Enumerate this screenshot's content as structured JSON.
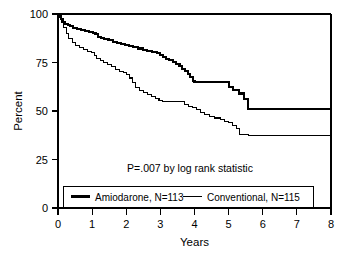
{
  "chart_data": {
    "type": "line",
    "subtype": "kaplan-meier-step",
    "title": "",
    "xlabel": "Years",
    "ylabel": "Percent",
    "xlim": [
      0,
      8
    ],
    "ylim": [
      0,
      100
    ],
    "xticks": [
      0,
      1,
      2,
      3,
      4,
      5,
      6,
      7,
      8
    ],
    "xtick_labels": [
      "0",
      "1",
      "2",
      "3",
      "4",
      "5",
      "6",
      "7",
      "8"
    ],
    "yticks": [
      0,
      25,
      50,
      75,
      100
    ],
    "ytick_labels": [
      "0",
      "25",
      "50",
      "75",
      "100"
    ],
    "grid": false,
    "legend_position": "inside-bottom",
    "annotations": [
      {
        "name": "p-value-annotation",
        "text": "P=.007 by log rank statistic",
        "x": 3.6,
        "y": 29
      }
    ],
    "series": [
      {
        "name": "Amiodarone, N=113",
        "label": "Amiodarone",
        "n": 113,
        "line_width": "thick",
        "color": "#000000",
        "final_value": 50.5,
        "points": [
          [
            0.0,
            100.0
          ],
          [
            0.06,
            99.0
          ],
          [
            0.1,
            97.5
          ],
          [
            0.14,
            96.0
          ],
          [
            0.2,
            95.0
          ],
          [
            0.28,
            94.2
          ],
          [
            0.36,
            93.6
          ],
          [
            0.45,
            93.0
          ],
          [
            0.55,
            92.4
          ],
          [
            0.68,
            91.8
          ],
          [
            0.8,
            91.2
          ],
          [
            0.92,
            90.8
          ],
          [
            1.02,
            90.4
          ],
          [
            1.1,
            89.5
          ],
          [
            1.18,
            88.2
          ],
          [
            1.26,
            87.6
          ],
          [
            1.36,
            87.0
          ],
          [
            1.48,
            86.4
          ],
          [
            1.6,
            85.8
          ],
          [
            1.72,
            85.2
          ],
          [
            1.84,
            84.6
          ],
          [
            1.96,
            84.0
          ],
          [
            2.08,
            83.4
          ],
          [
            2.2,
            82.8
          ],
          [
            2.34,
            82.2
          ],
          [
            2.48,
            81.6
          ],
          [
            2.62,
            81.0
          ],
          [
            2.76,
            80.4
          ],
          [
            2.9,
            79.8
          ],
          [
            3.0,
            79.0
          ],
          [
            3.08,
            77.8
          ],
          [
            3.16,
            77.0
          ],
          [
            3.26,
            76.2
          ],
          [
            3.36,
            75.4
          ],
          [
            3.46,
            74.2
          ],
          [
            3.56,
            73.0
          ],
          [
            3.64,
            71.8
          ],
          [
            3.72,
            70.6
          ],
          [
            3.8,
            69.2
          ],
          [
            3.88,
            67.6
          ],
          [
            3.95,
            65.6
          ],
          [
            4.0,
            65.0
          ],
          [
            4.95,
            65.0
          ],
          [
            5.02,
            62.6
          ],
          [
            5.12,
            61.0
          ],
          [
            5.3,
            59.0
          ],
          [
            5.45,
            56.0
          ],
          [
            5.58,
            51.0
          ],
          [
            8.0,
            50.5
          ]
        ]
      },
      {
        "name": "Conventional, N=115",
        "label": "Conventional",
        "n": 115,
        "line_width": "thin",
        "color": "#000000",
        "final_value": 37.6,
        "points": [
          [
            0.0,
            100.0
          ],
          [
            0.05,
            98.0
          ],
          [
            0.1,
            95.5
          ],
          [
            0.16,
            93.0
          ],
          [
            0.24,
            90.0
          ],
          [
            0.32,
            87.5
          ],
          [
            0.42,
            85.5
          ],
          [
            0.52,
            84.0
          ],
          [
            0.62,
            82.6
          ],
          [
            0.74,
            81.6
          ],
          [
            0.86,
            80.8
          ],
          [
            0.98,
            80.0
          ],
          [
            1.06,
            78.6
          ],
          [
            1.14,
            77.2
          ],
          [
            1.24,
            76.0
          ],
          [
            1.34,
            75.0
          ],
          [
            1.44,
            74.0
          ],
          [
            1.56,
            72.8
          ],
          [
            1.68,
            71.6
          ],
          [
            1.8,
            70.6
          ],
          [
            1.92,
            69.8
          ],
          [
            2.02,
            69.0
          ],
          [
            2.1,
            67.0
          ],
          [
            2.18,
            64.8
          ],
          [
            2.28,
            62.0
          ],
          [
            2.38,
            60.6
          ],
          [
            2.5,
            59.6
          ],
          [
            2.62,
            58.6
          ],
          [
            2.74,
            57.6
          ],
          [
            2.86,
            56.4
          ],
          [
            2.96,
            55.2
          ],
          [
            3.05,
            55.0
          ],
          [
            3.6,
            55.0
          ],
          [
            3.7,
            53.4
          ],
          [
            3.82,
            52.2
          ],
          [
            3.95,
            51.6
          ],
          [
            4.05,
            51.0
          ],
          [
            4.18,
            49.4
          ],
          [
            4.3,
            48.2
          ],
          [
            4.45,
            47.2
          ],
          [
            4.6,
            46.4
          ],
          [
            4.75,
            45.6
          ],
          [
            4.88,
            44.8
          ],
          [
            5.0,
            44.0
          ],
          [
            5.1,
            42.4
          ],
          [
            5.22,
            41.0
          ],
          [
            5.32,
            38.0
          ],
          [
            5.58,
            37.6
          ],
          [
            8.0,
            37.6
          ]
        ]
      }
    ]
  },
  "axes": {
    "x_axis_label": "Years",
    "y_axis_label": "Percent"
  },
  "legend": {
    "entries": [
      {
        "label": "Amiodarone, N=113",
        "style": "thick"
      },
      {
        "label": "Conventional, N=115",
        "style": "thin"
      }
    ]
  }
}
